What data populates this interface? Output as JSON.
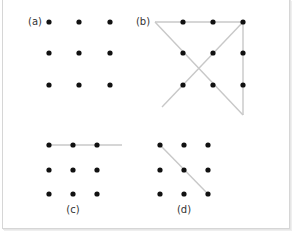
{
  "figure": {
    "line_color": "#c8c8c8",
    "dot_color": "#111111",
    "panels": [
      {
        "id": "a",
        "label": "(a)",
        "label_pos": [
          35,
          25
        ],
        "dots": [
          [
            49,
            22
          ],
          [
            79,
            22
          ],
          [
            110,
            22
          ],
          [
            49,
            53
          ],
          [
            79,
            53
          ],
          [
            110,
            53
          ],
          [
            49,
            85
          ],
          [
            79,
            85
          ],
          [
            110,
            85
          ]
        ],
        "lines": []
      },
      {
        "id": "b",
        "label": "(b)",
        "label_pos": [
          143,
          25
        ],
        "dots": [
          [
            183,
            22
          ],
          [
            213,
            22
          ],
          [
            243,
            22
          ],
          [
            183,
            53
          ],
          [
            213,
            53
          ],
          [
            243,
            53
          ],
          [
            183,
            85
          ],
          [
            213,
            85
          ],
          [
            243,
            85
          ]
        ],
        "lines": [
          [
            155,
            22,
            243,
            22
          ],
          [
            243,
            22,
            243,
            115
          ],
          [
            243,
            115,
            155,
            22
          ],
          [
            243,
            22,
            162,
            107
          ]
        ]
      },
      {
        "id": "c",
        "label": "(c)",
        "label_pos": [
          73,
          213
        ],
        "dots": [
          [
            49,
            145
          ],
          [
            73,
            145
          ],
          [
            97,
            145
          ],
          [
            49,
            170
          ],
          [
            73,
            170
          ],
          [
            97,
            170
          ],
          [
            49,
            194
          ],
          [
            73,
            194
          ],
          [
            97,
            194
          ]
        ],
        "lines": [
          [
            49,
            145,
            122,
            145
          ]
        ]
      },
      {
        "id": "d",
        "label": "(d)",
        "label_pos": [
          184,
          213
        ],
        "dots": [
          [
            160,
            145
          ],
          [
            184,
            145
          ],
          [
            208,
            145
          ],
          [
            160,
            170
          ],
          [
            184,
            170
          ],
          [
            208,
            170
          ],
          [
            160,
            194
          ],
          [
            184,
            194
          ],
          [
            208,
            194
          ]
        ],
        "lines": [
          [
            160,
            145,
            208,
            194
          ]
        ]
      }
    ]
  }
}
